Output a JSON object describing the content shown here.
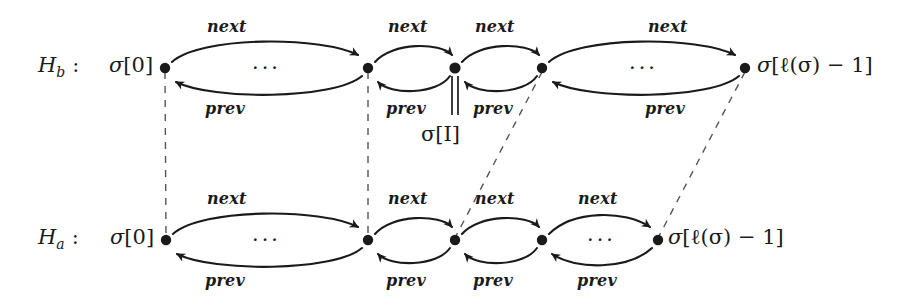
{
  "figure": {
    "type": "diagram",
    "background_color": "#ffffff",
    "ink_color": "#1a1a1a"
  },
  "rows": [
    {
      "id": "Hb",
      "name": "H",
      "subscript": "b",
      "colon": ":",
      "y": 68,
      "start_label": {
        "sigma": "σ",
        "index": "[0]"
      },
      "end_label": {
        "sigma": "σ",
        "index": "[ℓ(σ) − 1]"
      },
      "nodes_x": [
        165,
        368,
        455,
        542,
        745
      ],
      "ellipsis": "···",
      "ellipsis_positions": [
        266,
        643
      ]
    },
    {
      "id": "Ha",
      "name": "H",
      "subscript": "a",
      "colon": ":",
      "y": 240,
      "start_label": {
        "sigma": "σ",
        "index": "[0]"
      },
      "end_label": {
        "sigma": "σ",
        "index": "[ℓ(σ) − 1]"
      },
      "nodes_x": [
        166,
        368,
        455,
        542,
        658
      ],
      "ellipsis": "···",
      "ellipsis_positions": [
        266,
        600
      ]
    }
  ],
  "arc_labels": {
    "next": "next",
    "prev": "prev"
  },
  "annotations": {
    "sigma_i": {
      "sigma": "σ",
      "index": "[I]",
      "text": "σ[I]"
    },
    "double_bar": "‖"
  },
  "edges": {
    "top_next": [
      {
        "from": 165,
        "to": 368,
        "label": "next"
      },
      {
        "from": 368,
        "to": 455,
        "label": "next"
      },
      {
        "from": 455,
        "to": 542,
        "label": "next"
      },
      {
        "from": 542,
        "to": 745,
        "label": "next"
      }
    ],
    "top_prev": [
      {
        "from": 368,
        "to": 165,
        "label": "prev"
      },
      {
        "from": 455,
        "to": 368,
        "label": "prev"
      },
      {
        "from": 542,
        "to": 455,
        "label": "prev"
      },
      {
        "from": 745,
        "to": 542,
        "label": "prev"
      }
    ],
    "bottom_next": [
      {
        "from": 166,
        "to": 368,
        "label": "next"
      },
      {
        "from": 368,
        "to": 455,
        "label": "next"
      },
      {
        "from": 455,
        "to": 542,
        "label": "next"
      },
      {
        "from": 542,
        "to": 658,
        "label": "next"
      }
    ],
    "bottom_prev": [
      {
        "from": 368,
        "to": 166,
        "label": "prev"
      },
      {
        "from": 455,
        "to": 368,
        "label": "prev"
      },
      {
        "from": 542,
        "to": 455,
        "label": "prev"
      },
      {
        "from": 658,
        "to": 542,
        "label": "prev"
      }
    ],
    "dashed_links": [
      {
        "style": "vertical",
        "top_x": 165,
        "bottom_x": 166
      },
      {
        "style": "vertical",
        "top_x": 368,
        "bottom_x": 368
      },
      {
        "style": "diagonal",
        "top_x": 542,
        "bottom_x": 455
      },
      {
        "style": "diagonal",
        "top_x": 745,
        "bottom_x": 658
      }
    ]
  }
}
